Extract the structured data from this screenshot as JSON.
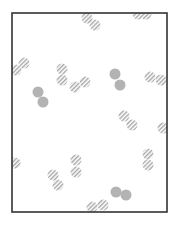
{
  "diagram": {
    "type": "particle-box",
    "frame": {
      "x": 12,
      "y": 13,
      "width": 155,
      "height": 199,
      "stroke": "#333333",
      "stroke_width": 1.6
    },
    "colors": {
      "solid": "#b3b3b3",
      "hatch": "#a6a6a6",
      "background": "#ffffff"
    },
    "particle_radius": 5.5,
    "solid_pairs": [
      [
        [
          38,
          92
        ],
        [
          43,
          102
        ]
      ],
      [
        [
          115,
          74
        ],
        [
          120,
          85
        ]
      ],
      [
        [
          116,
          192
        ],
        [
          126,
          195
        ]
      ]
    ],
    "hatched_pairs": [
      [
        [
          87,
          18
        ],
        [
          95,
          25
        ]
      ],
      [
        [
          138,
          14
        ],
        [
          146,
          14
        ]
      ],
      [
        [
          16,
          70
        ],
        [
          24,
          63
        ]
      ],
      [
        [
          62,
          69
        ],
        [
          62,
          80
        ]
      ],
      [
        [
          75,
          87
        ],
        [
          85,
          82
        ]
      ],
      [
        [
          150,
          77
        ],
        [
          161,
          80
        ]
      ],
      [
        [
          124,
          116
        ],
        [
          132,
          125
        ]
      ],
      [
        [
          76,
          160
        ],
        [
          76,
          172
        ]
      ],
      [
        [
          53,
          175
        ],
        [
          58,
          185
        ]
      ],
      [
        [
          148,
          154
        ],
        [
          148,
          165
        ]
      ],
      [
        [
          92,
          207
        ],
        [
          103,
          205
        ]
      ]
    ],
    "hatched_singles": [
      [
        163,
        128
      ],
      [
        15,
        163
      ]
    ]
  }
}
